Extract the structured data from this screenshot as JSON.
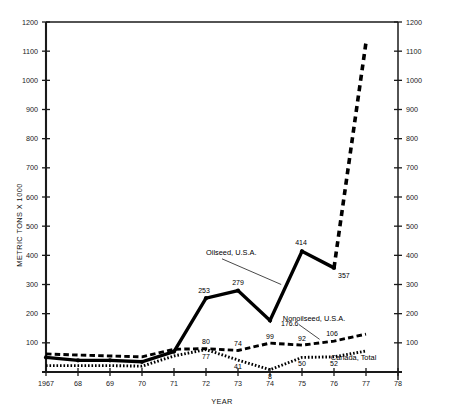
{
  "chart_data": {
    "type": "line",
    "title": "",
    "xlabel": "YEAR",
    "ylabel": "METRIC TONS X 1000",
    "xlim": [
      1967,
      1978
    ],
    "ylim": [
      0,
      1200
    ],
    "grid": false,
    "legend_position": "inline-annotations",
    "x_ticks": [
      "1967",
      "68",
      "69",
      "70",
      "71",
      "72",
      "73",
      "74",
      "75",
      "76",
      "77",
      "78"
    ],
    "x_tick_values": [
      1967,
      1968,
      1969,
      1970,
      1971,
      1972,
      1973,
      1974,
      1975,
      1976,
      1977,
      1978
    ],
    "y_ticks": [
      "100",
      "200",
      "300",
      "400",
      "500",
      "600",
      "700",
      "800",
      "900",
      "1000",
      "1100",
      "1200"
    ],
    "y_tick_values": [
      100,
      200,
      300,
      400,
      500,
      600,
      700,
      800,
      900,
      1000,
      1100,
      1200
    ],
    "right_axis_ticks": [
      "100",
      "200",
      "300",
      "400",
      "500",
      "600",
      "700",
      "800",
      "900",
      "1000",
      "1100",
      "1200"
    ],
    "series": [
      {
        "name": "Oilseed, U.S.A.",
        "style": "solid",
        "x": [
          1967,
          1968,
          1969,
          1970,
          1971,
          1972,
          1973,
          1974,
          1975,
          1976
        ],
        "values": [
          50,
          40,
          40,
          35,
          70,
          253,
          279,
          176.6,
          414,
          357
        ],
        "labels": [
          "",
          "",
          "",
          "",
          "",
          "253",
          "279",
          "176.6",
          "414",
          "357"
        ]
      },
      {
        "name": "Oilseed, U.S.A. (projected)",
        "style": "dashed-heavy",
        "x": [
          1976,
          1977
        ],
        "values": [
          357,
          1130
        ],
        "labels": [
          "",
          ""
        ]
      },
      {
        "name": "Nonoilseed, U.S.A.",
        "style": "dashed",
        "x": [
          1967,
          1968,
          1969,
          1970,
          1971,
          1972,
          1973,
          1974,
          1975,
          1976,
          1977
        ],
        "values": [
          62,
          58,
          55,
          52,
          78,
          80,
          74,
          99,
          92,
          106,
          130
        ],
        "labels": [
          "",
          "",
          "",
          "",
          "",
          "80",
          "74",
          "99",
          "92",
          "106",
          ""
        ]
      },
      {
        "name": "Canada, Total",
        "style": "dotted",
        "x": [
          1967,
          1968,
          1969,
          1970,
          1971,
          1972,
          1973,
          1974,
          1975,
          1976,
          1977
        ],
        "values": [
          22,
          22,
          22,
          20,
          55,
          77,
          41,
          8,
          50,
          52,
          72
        ],
        "labels": [
          "",
          "",
          "",
          "",
          "",
          "77",
          "41",
          "8",
          "50",
          "52",
          ""
        ]
      }
    ],
    "annotations": [
      {
        "text": "Oilseed, U.S.A.",
        "x": 1972.0,
        "y": 400,
        "leader_to_x": 1974.35,
        "leader_to_y": 300
      },
      {
        "text": "Nonoilseed, U.S.A.",
        "x": 1974.4,
        "y": 175,
        "leader_to_x": 1975.55,
        "leader_to_y": 112
      },
      {
        "text": "Canada, Total",
        "x": 1975.9,
        "y": 40,
        "leader_to_x": null,
        "leader_to_y": null
      }
    ]
  },
  "colors": {
    "axis": "#1a1a1a",
    "series_solid": "#000000",
    "series_dashed": "#111111",
    "series_dotted": "#222222",
    "background": "#ffffff"
  }
}
